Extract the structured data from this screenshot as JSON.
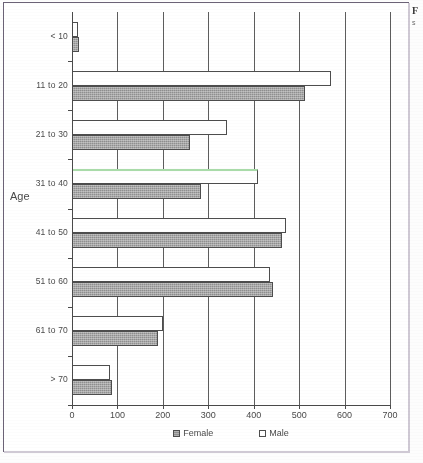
{
  "frame": {
    "border_color": "#6b6276"
  },
  "edge_fragment": {
    "bold_char": "F",
    "small_char": "s"
  },
  "chart_data": {
    "type": "bar",
    "orientation": "horizontal",
    "title": "",
    "xlabel": "",
    "ylabel": "Age",
    "categories": [
      "< 10",
      "11 to 20",
      "21 to 30",
      "31 to 40",
      "41 to 50",
      "51 to 60",
      "61 to 70",
      "> 70"
    ],
    "series": [
      {
        "name": "Male",
        "values": [
          14,
          570,
          342,
          410,
          472,
          435,
          200,
          84
        ],
        "color": "#ffffff"
      },
      {
        "name": "Female",
        "values": [
          16,
          512,
          260,
          285,
          462,
          443,
          190,
          88
        ],
        "color": "#8f8f8f"
      }
    ],
    "xlim": [
      0,
      700
    ],
    "xticks": [
      0,
      100,
      200,
      300,
      400,
      500,
      600,
      700
    ],
    "xtick_labels": [
      "0",
      "100",
      "200",
      "300",
      "400",
      "500",
      "600",
      "700"
    ],
    "grid": true,
    "grid_axis": "x",
    "legend_position": "bottom",
    "legend_entries": [
      "Female",
      "Male"
    ],
    "highlight": {
      "category": "31 to 40",
      "series": "Male",
      "edge_color": "#a9dba9"
    }
  }
}
